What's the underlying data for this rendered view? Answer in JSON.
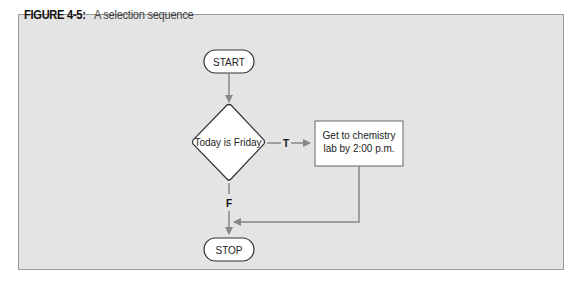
{
  "figure": {
    "number": "FIGURE 4-5:",
    "title": "A selection sequence"
  },
  "flowchart": {
    "start": {
      "label": "START",
      "shape": "terminator"
    },
    "decision": {
      "label": "Today is Friday",
      "shape": "diamond"
    },
    "process": {
      "line1": "Get to chemistry",
      "line2": "lab by 2:00 p.m.",
      "shape": "rectangle"
    },
    "stop": {
      "label": "STOP",
      "shape": "terminator"
    },
    "true_label": "T",
    "false_label": "F"
  },
  "colors": {
    "panel_bg": "#e4e4e4",
    "panel_border": "#9a9a9a",
    "shape_fill": "#ffffff",
    "shape_stroke": "#333333",
    "arrow": "#888888"
  }
}
